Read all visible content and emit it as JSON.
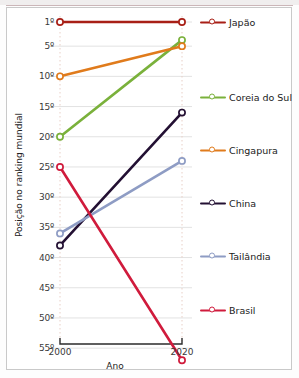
{
  "chart_data": {
    "type": "line",
    "title": "",
    "xlabel": "Ano",
    "ylabel": "Posição no ranking mundial",
    "x": [
      2000,
      2020
    ],
    "xtick_labels": [
      "2000",
      "2020"
    ],
    "ytick_values": [
      1,
      5,
      10,
      15,
      20,
      25,
      30,
      35,
      40,
      45,
      50,
      55
    ],
    "ytick_labels": [
      "1º",
      "5º",
      "10º",
      "15º",
      "20º",
      "25º",
      "30º",
      "35º",
      "40º",
      "45º",
      "50º",
      "55º"
    ],
    "ylim": [
      1,
      57
    ],
    "y_inverted": true,
    "grid": true,
    "legend_position": "right",
    "series": [
      {
        "name": "Japão",
        "color": "#a81f16",
        "values": [
          1,
          1
        ]
      },
      {
        "name": "Coreia do Sul",
        "color": "#7ab13b",
        "values": [
          20,
          4
        ]
      },
      {
        "name": "Cingapura",
        "color": "#e07b1c",
        "values": [
          10,
          5
        ]
      },
      {
        "name": "China",
        "color": "#231033",
        "values": [
          38,
          16
        ]
      },
      {
        "name": "Tailândia",
        "color": "#8e9cc4",
        "values": [
          36,
          24
        ]
      },
      {
        "name": "Brasil",
        "color": "#d01b3c",
        "values": [
          25,
          57
        ]
      }
    ]
  },
  "legend": {
    "items": [
      {
        "label": "Japão"
      },
      {
        "label": "Coreia do Sul"
      },
      {
        "label": "Cingapura"
      },
      {
        "label": "China"
      },
      {
        "label": "Tailândia"
      },
      {
        "label": "Brasil"
      }
    ]
  },
  "axes": {
    "x_title": "Ano",
    "y_title": "Posição no ranking mundial"
  }
}
